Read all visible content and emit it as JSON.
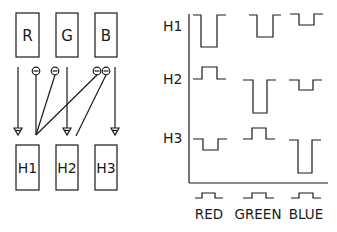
{
  "diagram": {
    "left": {
      "inputs": [
        {
          "id": "R",
          "label": "R"
        },
        {
          "id": "G",
          "label": "G"
        },
        {
          "id": "B",
          "label": "B"
        }
      ],
      "outputs": [
        {
          "id": "H1",
          "label": "H1"
        },
        {
          "id": "H2",
          "label": "H2"
        },
        {
          "id": "H3",
          "label": "H3"
        }
      ],
      "connections": [
        {
          "from": "R",
          "to": "H1",
          "sign": "excitatory"
        },
        {
          "from": "G",
          "to": "H2",
          "sign": "excitatory"
        },
        {
          "from": "B",
          "to": "H3",
          "sign": "excitatory"
        },
        {
          "from": "R",
          "to": "H1",
          "sign": "inhibitory",
          "symbol": "⊖"
        },
        {
          "from": "G",
          "to": "H1",
          "sign": "inhibitory",
          "symbol": "⊖"
        },
        {
          "from": "B",
          "to": "H1",
          "sign": "inhibitory",
          "symbol": "⊖"
        },
        {
          "from": "B",
          "to": "H2",
          "sign": "inhibitory",
          "symbol": "⊖"
        }
      ]
    },
    "right": {
      "row_labels": [
        "H1",
        "H2",
        "H3"
      ],
      "column_labels": [
        "RED",
        "GREEN",
        "BLUE"
      ],
      "stimulus": "step pulse",
      "responses": {
        "H1": {
          "RED": "large hyperpolarization",
          "GREEN": "medium hyperpolarization",
          "BLUE": "small hyperpolarization"
        },
        "H2": {
          "RED": "small depolarization",
          "GREEN": "large hyperpolarization",
          "BLUE": "small hyperpolarization"
        },
        "H3": {
          "RED": "small hyperpolarization",
          "GREEN": "small depolarization",
          "BLUE": "large hyperpolarization"
        }
      }
    }
  }
}
